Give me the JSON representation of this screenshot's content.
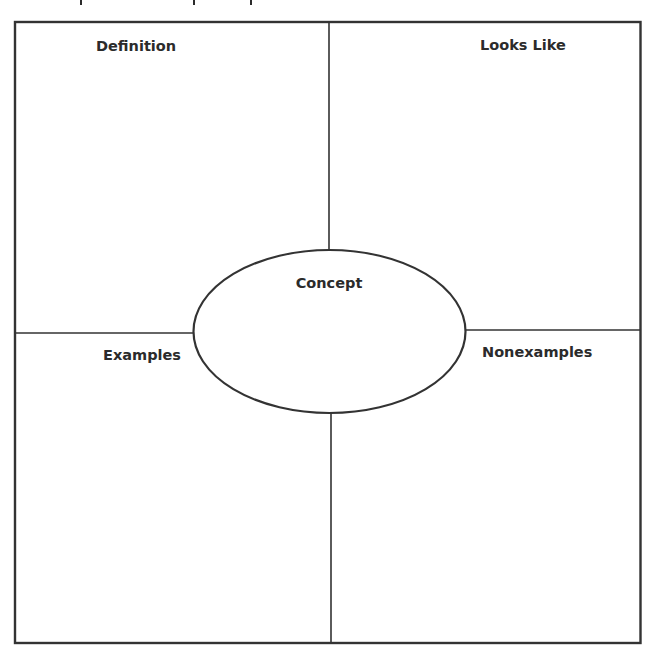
{
  "diagram": {
    "type": "concept-map (Frayer model)",
    "quadrants": {
      "top_left": {
        "label": "Definition"
      },
      "top_right": {
        "label": "Looks Like"
      },
      "bottom_left": {
        "label": "Examples"
      },
      "bottom_right": {
        "label": "Nonexamples"
      }
    },
    "center": {
      "label": "Concept"
    },
    "colors": {
      "line": "#333333",
      "text": "#2b2b2b",
      "background": "#ffffff"
    }
  }
}
